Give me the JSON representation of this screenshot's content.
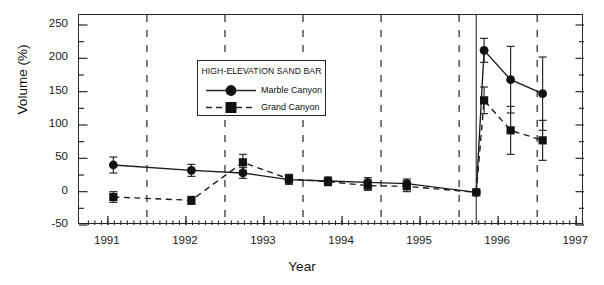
{
  "chart_data": {
    "type": "line",
    "title": "",
    "xlabel": "Year",
    "ylabel": "Volume (%)",
    "xlim": [
      1990.63,
      1997.1
    ],
    "ylim": [
      -50,
      265
    ],
    "yticks": [
      -50,
      0,
      50,
      100,
      150,
      200,
      250
    ],
    "ytick_labels": [
      "-50",
      "0",
      "50",
      "100",
      "150",
      "200",
      "250"
    ],
    "yminor_step": 25,
    "xticks": [
      1991,
      1992,
      1993,
      1994,
      1995,
      1996,
      1997
    ],
    "xtick_labels": [
      "1991",
      "1992",
      "1993",
      "1994",
      "1995",
      "1996",
      "1997"
    ],
    "xminor_step": 0.0833,
    "grid": "vertical-dashed-at-midyear",
    "gridlines_x": [
      1991.5,
      1992.5,
      1993.5,
      1994.5,
      1995.5,
      1996.5
    ],
    "event_line_x": 1995.72,
    "event_line_note": "solid vertical line marking the 1996 controlled flood",
    "legend": {
      "title": "HIGH-ELEVATION SAND BAR",
      "position": "upper-left-inside",
      "entries": [
        {
          "label": "Marble Canyon",
          "marker": "circle",
          "linestyle": "solid"
        },
        {
          "label": "Grand Canyon",
          "marker": "square",
          "linestyle": "dashed"
        }
      ]
    },
    "series": [
      {
        "name": "Marble Canyon",
        "marker": "circle",
        "linestyle": "solid",
        "points": [
          {
            "x": 1991.07,
            "y": 40,
            "yerr": 12
          },
          {
            "x": 1992.07,
            "y": 32,
            "yerr": 9
          },
          {
            "x": 1992.73,
            "y": 28,
            "yerr": 8
          },
          {
            "x": 1993.32,
            "y": 18,
            "yerr": 7
          },
          {
            "x": 1993.82,
            "y": 16,
            "yerr": 6
          },
          {
            "x": 1994.33,
            "y": 14,
            "yerr": 7
          },
          {
            "x": 1994.83,
            "y": 12,
            "yerr": 7
          },
          {
            "x": 1995.72,
            "y": -1,
            "yerr": 0
          },
          {
            "x": 1995.82,
            "y": 212,
            "yerr": 18
          },
          {
            "x": 1996.16,
            "y": 168,
            "yerr": 50
          },
          {
            "x": 1996.57,
            "y": 147,
            "yerr": 55
          }
        ]
      },
      {
        "name": "Grand Canyon",
        "marker": "square",
        "linestyle": "dashed",
        "points": [
          {
            "x": 1991.07,
            "y": -8,
            "yerr": 8
          },
          {
            "x": 1992.07,
            "y": -13,
            "yerr": 6
          },
          {
            "x": 1992.73,
            "y": 44,
            "yerr": 12
          },
          {
            "x": 1993.32,
            "y": 19,
            "yerr": 7
          },
          {
            "x": 1993.82,
            "y": 15,
            "yerr": 6
          },
          {
            "x": 1994.33,
            "y": 9,
            "yerr": 7
          },
          {
            "x": 1994.83,
            "y": 8,
            "yerr": 8
          },
          {
            "x": 1995.72,
            "y": -1,
            "yerr": 0
          },
          {
            "x": 1995.82,
            "y": 137,
            "yerr": 20
          },
          {
            "x": 1996.16,
            "y": 92,
            "yerr": 36
          },
          {
            "x": 1996.57,
            "y": 77,
            "yerr": 30
          }
        ]
      }
    ]
  },
  "style": {
    "ink": "#262626",
    "text": "#111111",
    "background": "#ffffff"
  }
}
